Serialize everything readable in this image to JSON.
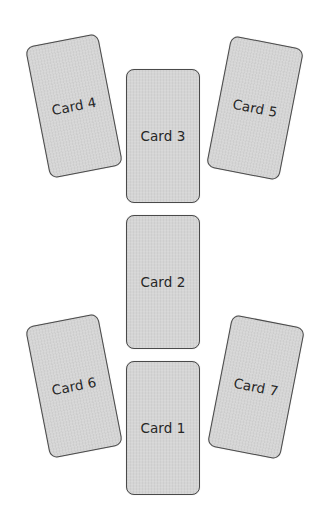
{
  "layout": {
    "name": "Seven-card spread",
    "cards": [
      {
        "label": "Card 1",
        "position": 1
      },
      {
        "label": "Card 2",
        "position": 2
      },
      {
        "label": "Card 3",
        "position": 3
      },
      {
        "label": "Card 4",
        "position": 4
      },
      {
        "label": "Card 5",
        "position": 5
      },
      {
        "label": "Card 6",
        "position": 6
      },
      {
        "label": "Card 7",
        "position": 7
      }
    ]
  },
  "colors": {
    "card_fill": "#d5d5d5",
    "card_border": "#4a4a4a",
    "label_text": "#262626",
    "background": "#ffffff"
  }
}
